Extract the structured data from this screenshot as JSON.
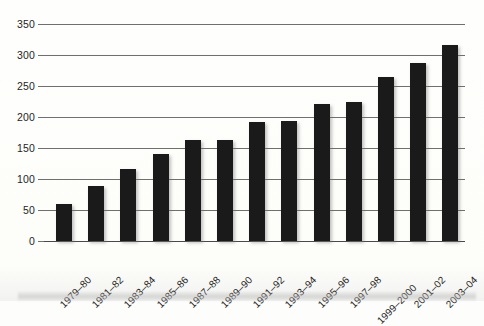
{
  "chart_data": {
    "type": "bar",
    "title": "",
    "subtitle": "",
    "xlabel": "",
    "ylabel": "",
    "categories": [
      "1979–80",
      "1981–82",
      "1983–84",
      "1985–86",
      "1987–88",
      "1989–90",
      "1991–92",
      "1993–94",
      "1995–96",
      "1997–98",
      "1999–2000",
      "2001–02",
      "2003–04"
    ],
    "values": [
      60,
      89,
      116,
      140,
      163,
      163,
      192,
      194,
      221,
      224,
      264,
      287,
      316
    ],
    "ylim": [
      0,
      350
    ],
    "ytick_labels": [
      "0",
      "50",
      "100",
      "150",
      "200",
      "250",
      "300",
      "350"
    ],
    "ytick_values": [
      0,
      50,
      100,
      150,
      200,
      250,
      300,
      350
    ],
    "grid": true,
    "grid_axis": "y",
    "legend": false,
    "legend_position": "none",
    "bar_color": "#1a1a1a",
    "grid_color": "#6f6f6f",
    "axis_color": "#4a4a4a",
    "background_color": "#fdfdfb",
    "text_color": "#1f1f1f",
    "xtick_rotation": -45
  }
}
